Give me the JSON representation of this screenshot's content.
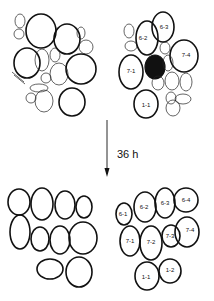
{
  "figure": {
    "time_label": "36 h",
    "top_right_labels": [
      "6-3",
      "6-2",
      "7-4",
      "7-1",
      "1-1"
    ],
    "bottom_right_labels": [
      "6-1",
      "6-2",
      "6-3",
      "6-4",
      "7-1",
      "7-2",
      "7-3",
      "7-4",
      "1-1",
      "1-2"
    ]
  }
}
